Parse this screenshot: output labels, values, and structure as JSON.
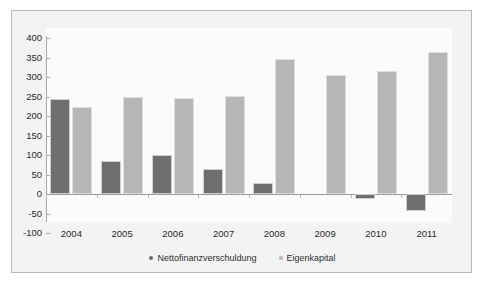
{
  "chart_data": {
    "type": "bar",
    "title": "",
    "subtitle": "",
    "xlabel": "",
    "ylabel": "",
    "categories": [
      "2004",
      "2005",
      "2006",
      "2007",
      "2008",
      "2009",
      "2010",
      "2011"
    ],
    "series": [
      {
        "name": "Nettofinanzverschuldung",
        "color": "#6e6e6e",
        "values": [
          244,
          85,
          100,
          64,
          28,
          0,
          -12,
          -44
        ]
      },
      {
        "name": "Eigenkapital",
        "color": "#b6b6b6",
        "values": [
          223,
          248,
          247,
          252,
          346,
          305,
          315,
          364
        ]
      }
    ],
    "ylim": [
      -100,
      400
    ],
    "yticks": [
      400,
      350,
      300,
      250,
      200,
      150,
      100,
      50,
      0,
      -50,
      -100
    ],
    "ytick_labels": [
      "400",
      "350",
      "300",
      "250",
      "200",
      "150",
      "100",
      "50",
      "0",
      "-50",
      "-100"
    ],
    "grid": false,
    "legend_position": "bottom",
    "legend": [
      {
        "label": "Nettofinanzverschuldung",
        "marker": "dot-marker",
        "color": "#6e6e6e"
      },
      {
        "label": "Eigenkapital",
        "marker": "dot-marker",
        "color": "#b6b6b6"
      }
    ],
    "annotations": []
  }
}
